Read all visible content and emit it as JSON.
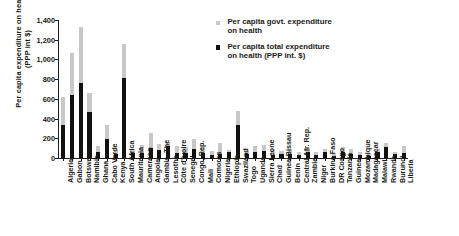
{
  "chart_data": {
    "type": "bar",
    "title": "",
    "xlabel": "",
    "ylabel": "Per capita expenditure on health (PPP int $)",
    "ylim": [
      0,
      1400
    ],
    "ytick_values": [
      0,
      200,
      400,
      600,
      800,
      1000,
      1200,
      1400
    ],
    "ytick_labels": [
      "0",
      "200",
      "400",
      "600",
      "800",
      "1,000",
      "1,200",
      "1,400"
    ],
    "grid": false,
    "legend_position": "top-right",
    "orientation": "vertical",
    "overlay": "two overlaid bars per category; light gray is total-height backdrop, black is drawn in front",
    "categories": [
      "Algeria",
      "Gabon",
      "Botswana",
      "Namibia",
      "Ghana",
      "Cabo Verde",
      "Kenya",
      "South Africa",
      "Mauritania",
      "Cameroon",
      "Angola",
      "Gambia, The",
      "Lesotho",
      "Côte d'Ivoire",
      "Senegal",
      "Congo, Rep.",
      "Mali",
      "Comoros",
      "Nigeria",
      "Ethiopia",
      "Swaziland",
      "Togo",
      "Uganda",
      "Sierra Leone",
      "Chad",
      "Guinea-Bissau",
      "Benin",
      "Central Afr. Rep.",
      "Zambia",
      "Niger",
      "Burkina Faso",
      "DR Congo",
      "Tanzania",
      "Guinea",
      "Mozambique",
      "Madagascar",
      "Malawi",
      "Rwanda",
      "Burundi",
      "Liberia"
    ],
    "series": [
      {
        "name": "Per capita govt. expenditure on health",
        "color": "#c8c8c8",
        "values": [
          620,
          1070,
          1325,
          660,
          120,
          330,
          95,
          1160,
          95,
          130,
          250,
          140,
          165,
          120,
          110,
          195,
          110,
          70,
          150,
          85,
          480,
          85,
          120,
          135,
          90,
          70,
          90,
          60,
          105,
          60,
          95,
          55,
          110,
          90,
          65,
          55,
          95,
          150,
          60,
          120
        ]
      },
      {
        "name": "Per capita total expenditure on health (PPP int. $)",
        "color": "#111111",
        "values": [
          330,
          640,
          765,
          470,
          60,
          195,
          40,
          815,
          50,
          55,
          105,
          85,
          125,
          50,
          55,
          90,
          55,
          30,
          40,
          60,
          330,
          45,
          60,
          75,
          30,
          45,
          40,
          35,
          60,
          35,
          60,
          25,
          60,
          40,
          35,
          25,
          65,
          110,
          45,
          55
        ]
      }
    ]
  },
  "legend": {
    "items": [
      {
        "label_line1": "Per capita govt. expenditure",
        "label_line2": "on health",
        "color": "#c8c8c8"
      },
      {
        "label_line1": "Per capita total expenditure",
        "label_line2": "on health (PPP int. $)",
        "color": "#111111"
      }
    ]
  }
}
